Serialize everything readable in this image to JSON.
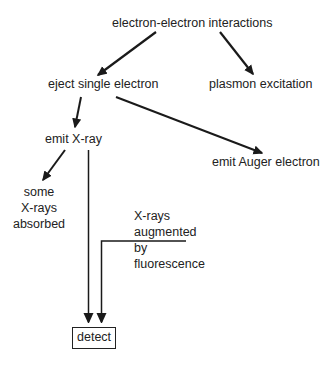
{
  "diagram": {
    "type": "flowchart",
    "colors": {
      "line": "#1a1a1a",
      "text": "#222222",
      "background": "#ffffff"
    },
    "nodes": {
      "root": {
        "label": "electron-electron interactions"
      },
      "eject": {
        "label": "eject single electron"
      },
      "plasmon": {
        "label": "plasmon excitation"
      },
      "xray": {
        "label": "emit X-ray"
      },
      "auger": {
        "label": "emit Auger electron"
      },
      "absorbed": {
        "lines": [
          "some",
          "X-rays",
          "absorbed"
        ]
      },
      "fluorescence": {
        "lines": [
          "X-rays",
          "augmented",
          "by",
          "fluorescence"
        ]
      },
      "detect": {
        "label": "detect"
      }
    },
    "edges": [
      {
        "from": "electron-electron interactions",
        "to": "eject single electron"
      },
      {
        "from": "electron-electron interactions",
        "to": "plasmon excitation"
      },
      {
        "from": "eject single electron",
        "to": "emit X-ray"
      },
      {
        "from": "eject single electron",
        "to": "emit Auger electron"
      },
      {
        "from": "emit X-ray",
        "to": "some X-rays absorbed"
      },
      {
        "from": "emit X-ray",
        "to": "detect"
      },
      {
        "from": "X-rays augmented by fluorescence",
        "to": "detect"
      }
    ]
  }
}
